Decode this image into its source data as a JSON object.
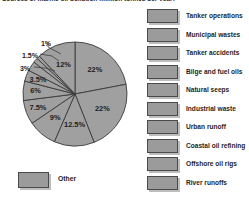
{
  "chart_data": {
    "type": "pie",
    "title": "Sources of marine oil pollution (million tonnes per year)",
    "xlabel": "",
    "ylabel": "",
    "legend_position": "right",
    "grid": false,
    "value_unit": "%",
    "categories": [
      "Tanker operations",
      "Municipal wastes",
      "Tanker accidents",
      "Bilge and fuel oils",
      "Natural seeps",
      "Industrial waste",
      "Urban runoff",
      "Coastal oil refining",
      "Offshore oil rigs",
      "River runoffs",
      "Other"
    ],
    "values": [
      22,
      22,
      12.5,
      9,
      7.5,
      6,
      3.5,
      3,
      1.5,
      1,
      12
    ],
    "labels": [
      "22%",
      "22%",
      "12.5%",
      "9%",
      "7.5%",
      "6%",
      "3.5%",
      "3%",
      "1.5%",
      "1%",
      "12%"
    ],
    "slices": [
      {
        "label": "22%",
        "value": 22,
        "name": "Tanker operations"
      },
      {
        "label": "22%",
        "value": 22,
        "name": "Municipal wastes"
      },
      {
        "label": "12.5%",
        "value": 12.5,
        "name": "Tanker accidents"
      },
      {
        "label": "9%",
        "value": 9,
        "name": "Bilge and fuel oils"
      },
      {
        "label": "7.5%",
        "value": 7.5,
        "name": "Natural seeps"
      },
      {
        "label": "6%",
        "value": 6,
        "name": "Industrial waste"
      },
      {
        "label": "3.5%",
        "value": 3.5,
        "name": "Urban runoff"
      },
      {
        "label": "3%",
        "value": 3,
        "name": "Coastal oil refining"
      },
      {
        "label": "1.5%",
        "value": 1.5,
        "name": "Offshore oil rigs"
      },
      {
        "label": "1%",
        "value": 1,
        "name": "River runoffs"
      },
      {
        "label": "12%",
        "value": 12,
        "name": "Other"
      }
    ],
    "colors": {
      "slice_fill": "#a0a0a0",
      "slice_stroke": "#3a3a3a",
      "swatch_fill": "#9b9b9b",
      "swatch_border": "#4a4a4a",
      "text": "#1c1c1c",
      "background": "#ffffff"
    }
  },
  "legend": {
    "items": [
      {
        "label": "Tanker operations"
      },
      {
        "label": "Municipal wastes"
      },
      {
        "label": "Tanker accidents"
      },
      {
        "label": "Bilge and fuel oils"
      },
      {
        "label": "Natural seeps"
      },
      {
        "label": "Industrial waste"
      },
      {
        "label": "Urban runoff"
      },
      {
        "label": "Coastal oil refining"
      },
      {
        "label": "Offshore oil rigs"
      },
      {
        "label": "River runoffs"
      }
    ],
    "other": {
      "label": "Other"
    }
  }
}
